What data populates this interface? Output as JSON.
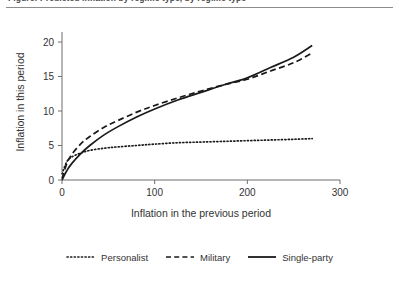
{
  "caption": {
    "text": "Figure: Predicted inflation by regime type, by regime type",
    "rule_color": "#8c8c8c"
  },
  "chart_data": {
    "type": "line",
    "title": "",
    "xlabel": "Inflation in the previous period",
    "ylabel": "Inflation in this period",
    "xlim": [
      0,
      300
    ],
    "ylim": [
      0,
      20
    ],
    "xticks": [
      0,
      100,
      200,
      300
    ],
    "yticks": [
      0,
      5,
      10,
      15,
      20
    ],
    "xtick_labels": [
      "0",
      "100",
      "200",
      "300"
    ],
    "ytick_labels": [
      "0",
      "5",
      "10",
      "15",
      "20"
    ],
    "grid": false,
    "legend_position": "below",
    "x": [
      0,
      5,
      10,
      20,
      30,
      45,
      60,
      80,
      100,
      125,
      150,
      175,
      200,
      225,
      250,
      270
    ],
    "series": [
      {
        "name": "Personalist",
        "style": "dotted",
        "color": "#1a1a1a",
        "values": [
          0.9,
          2.6,
          3.3,
          3.9,
          4.3,
          4.6,
          4.8,
          5.0,
          5.2,
          5.4,
          5.5,
          5.6,
          5.7,
          5.8,
          5.9,
          6.0
        ]
      },
      {
        "name": "Military",
        "style": "dashed",
        "color": "#1a1a1a",
        "values": [
          0.2,
          2.3,
          3.6,
          5.2,
          6.3,
          7.6,
          8.6,
          9.8,
          10.8,
          11.9,
          12.9,
          13.8,
          14.6,
          15.8,
          17.0,
          18.4
        ]
      },
      {
        "name": "Single-party",
        "style": "solid",
        "color": "#1a1a1a",
        "values": [
          0.0,
          1.3,
          2.3,
          3.8,
          5.0,
          6.5,
          7.7,
          9.1,
          10.3,
          11.6,
          12.7,
          13.8,
          14.8,
          16.3,
          17.8,
          19.5
        ]
      }
    ]
  },
  "axis": {
    "line_color": "#6e6e6e",
    "tick_color": "#6e6e6e",
    "label_color": "#333333"
  }
}
